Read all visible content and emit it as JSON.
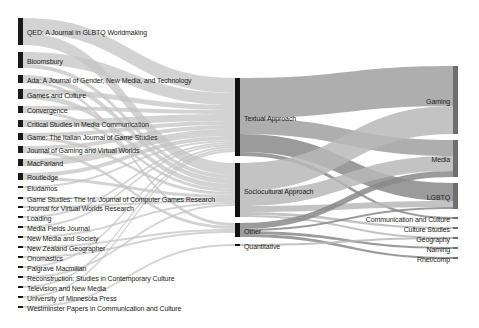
{
  "chart_data": {
    "type": "sankey",
    "title": "",
    "columns": [
      "Publication Venue",
      "Approach",
      "Field"
    ],
    "colors": {
      "node_left": "#1a1a1a",
      "node_mid": "#111111",
      "node_right": "#6e6e6e",
      "flow_left": "#c4c4c4",
      "flow_mid": "#a0a0a0",
      "flow_mid_dark": "#8a8a8a",
      "background": "#ffffff"
    },
    "nodes_left": [
      {
        "id": "qed",
        "label": "QED: A Journal in GLBTQ Worldmaking",
        "y0": 18,
        "y1": 45
      },
      {
        "id": "bloomsbury",
        "label": "Bloomsbury",
        "y0": 52,
        "y1": 68
      },
      {
        "id": "ada",
        "label": "Ada: A Journal of Gender, New Media, and Technology",
        "y0": 75,
        "y1": 83
      },
      {
        "id": "gac",
        "label": "Games and Culture",
        "y0": 89,
        "y1": 99
      },
      {
        "id": "convergence",
        "label": "Convergence",
        "y0": 106,
        "y1": 113
      },
      {
        "id": "csmc",
        "label": "Critical Studies in Media Communication",
        "y0": 120,
        "y1": 127
      },
      {
        "id": "game_ital",
        "label": "Game: The Italian Journal of Game Studies",
        "y0": 133,
        "y1": 140
      },
      {
        "id": "jgvw",
        "label": "Journal of Gaming and Virtual Worlds",
        "y0": 146,
        "y1": 153
      },
      {
        "id": "macfarland",
        "label": "MacFarland",
        "y0": 159,
        "y1": 166
      },
      {
        "id": "routledge",
        "label": "Routledge",
        "y0": 173,
        "y1": 180
      },
      {
        "id": "eludamos",
        "label": "Eludamos",
        "y0": 186,
        "y1": 188
      },
      {
        "id": "gamestudies",
        "label": "Game Studies: The Int. Journal of Computer Games Research",
        "y0": 197,
        "y1": 199
      },
      {
        "id": "jvwr",
        "label": "Journal for Virtual Worlds Research",
        "y0": 206,
        "y1": 208
      },
      {
        "id": "loading",
        "label": "Loading",
        "y0": 216,
        "y1": 218
      },
      {
        "id": "mfj",
        "label": "Media Fields Journal",
        "y0": 226,
        "y1": 228
      },
      {
        "id": "nms",
        "label": "New Media and Society",
        "y0": 236,
        "y1": 238
      },
      {
        "id": "nzg",
        "label": "New Zealand Geographer",
        "y0": 246,
        "y1": 248
      },
      {
        "id": "onomastics",
        "label": "Onomastics",
        "y0": 256,
        "y1": 258
      },
      {
        "id": "palgrave",
        "label": "Palgrave Macmillan",
        "y0": 266,
        "y1": 268
      },
      {
        "id": "reconstruction",
        "label": "Reconstruction: Studies in Contemporary Culture",
        "y0": 276,
        "y1": 278
      },
      {
        "id": "tnm",
        "label": "Television and New Media",
        "y0": 286,
        "y1": 288
      },
      {
        "id": "umn",
        "label": "University of Minnesota Press",
        "y0": 296,
        "y1": 298
      },
      {
        "id": "westminster",
        "label": "Westminster Papers in Communication and Culture",
        "y0": 306,
        "y1": 308
      }
    ],
    "nodes_mid": [
      {
        "id": "textual",
        "label": "Textual Approach",
        "y0": 78,
        "y1": 156
      },
      {
        "id": "socio",
        "label": "Sociocultural Approach",
        "y0": 163,
        "y1": 217
      },
      {
        "id": "other",
        "label": "Other",
        "y0": 223,
        "y1": 237
      },
      {
        "id": "quant",
        "label": "Quantitative",
        "y0": 244,
        "y1": 246
      }
    ],
    "nodes_right": [
      {
        "id": "gaming",
        "label": "Gaming",
        "y0": 66,
        "y1": 134
      },
      {
        "id": "media",
        "label": "Media",
        "y0": 140,
        "y1": 177
      },
      {
        "id": "lgbtq",
        "label": "LGBTQ",
        "y0": 183,
        "y1": 209
      },
      {
        "id": "commcult",
        "label": "Communication and Culture",
        "y0": 217,
        "y1": 219
      },
      {
        "id": "cultstud",
        "label": "Culture Studies",
        "y0": 227,
        "y1": 229
      },
      {
        "id": "geography",
        "label": "Geography",
        "y0": 237,
        "y1": 239
      },
      {
        "id": "naming",
        "label": "Naming",
        "y0": 247,
        "y1": 249
      },
      {
        "id": "rhetcomp",
        "label": "Rhet/comp",
        "y0": 257,
        "y1": 259
      }
    ],
    "links_left": [
      {
        "source": "qed",
        "target": "textual",
        "s0": 18,
        "s1": 33,
        "t0": 78,
        "t1": 93
      },
      {
        "source": "qed",
        "target": "socio",
        "s0": 33,
        "s1": 45,
        "t0": 163,
        "t1": 175
      },
      {
        "source": "bloomsbury",
        "target": "textual",
        "s0": 52,
        "s1": 64,
        "t0": 93,
        "t1": 105
      },
      {
        "source": "bloomsbury",
        "target": "socio",
        "s0": 64,
        "s1": 68,
        "t0": 175,
        "t1": 179
      },
      {
        "source": "ada",
        "target": "socio",
        "s0": 75,
        "s1": 80,
        "t0": 179,
        "t1": 184
      },
      {
        "source": "ada",
        "target": "other",
        "s0": 80,
        "s1": 83,
        "t0": 223,
        "t1": 226
      },
      {
        "source": "gac",
        "target": "textual",
        "s0": 89,
        "s1": 94,
        "t0": 105,
        "t1": 110
      },
      {
        "source": "gac",
        "target": "socio",
        "s0": 94,
        "s1": 99,
        "t0": 184,
        "t1": 189
      },
      {
        "source": "convergence",
        "target": "textual",
        "s0": 106,
        "s1": 110,
        "t0": 110,
        "t1": 114
      },
      {
        "source": "convergence",
        "target": "socio",
        "s0": 110,
        "s1": 113,
        "t0": 189,
        "t1": 192
      },
      {
        "source": "csmc",
        "target": "textual",
        "s0": 120,
        "s1": 127,
        "t0": 114,
        "t1": 121
      },
      {
        "source": "game_ital",
        "target": "textual",
        "s0": 133,
        "s1": 137,
        "t0": 121,
        "t1": 125
      },
      {
        "source": "game_ital",
        "target": "socio",
        "s0": 137,
        "s1": 140,
        "t0": 192,
        "t1": 195
      },
      {
        "source": "jgvw",
        "target": "textual",
        "s0": 146,
        "s1": 150,
        "t0": 125,
        "t1": 129
      },
      {
        "source": "jgvw",
        "target": "other",
        "s0": 150,
        "s1": 153,
        "t0": 226,
        "t1": 229
      },
      {
        "source": "macfarland",
        "target": "textual",
        "s0": 159,
        "s1": 166,
        "t0": 129,
        "t1": 136
      },
      {
        "source": "routledge",
        "target": "textual",
        "s0": 173,
        "s1": 177,
        "t0": 136,
        "t1": 140
      },
      {
        "source": "routledge",
        "target": "socio",
        "s0": 177,
        "s1": 180,
        "t0": 195,
        "t1": 198
      },
      {
        "source": "eludamos",
        "target": "textual",
        "s0": 186,
        "s1": 188,
        "t0": 140,
        "t1": 142
      },
      {
        "source": "gamestudies",
        "target": "socio",
        "s0": 197,
        "s1": 199,
        "t0": 198,
        "t1": 200
      },
      {
        "source": "jvwr",
        "target": "socio",
        "s0": 206,
        "s1": 208,
        "t0": 200,
        "t1": 202
      },
      {
        "source": "loading",
        "target": "textual",
        "s0": 216,
        "s1": 218,
        "t0": 142,
        "t1": 144
      },
      {
        "source": "mfj",
        "target": "textual",
        "s0": 226,
        "s1": 228,
        "t0": 144,
        "t1": 146
      },
      {
        "source": "nms",
        "target": "socio",
        "s0": 236,
        "s1": 238,
        "t0": 202,
        "t1": 204
      },
      {
        "source": "nzg",
        "target": "other",
        "s0": 246,
        "s1": 248,
        "t0": 229,
        "t1": 231
      },
      {
        "source": "onomastics",
        "target": "other",
        "s0": 256,
        "s1": 258,
        "t0": 231,
        "t1": 233
      },
      {
        "source": "palgrave",
        "target": "textual",
        "s0": 266,
        "s1": 268,
        "t0": 146,
        "t1": 148
      },
      {
        "source": "reconstruction",
        "target": "socio",
        "s0": 276,
        "s1": 278,
        "t0": 204,
        "t1": 206
      },
      {
        "source": "tnm",
        "target": "textual",
        "s0": 286,
        "s1": 288,
        "t0": 148,
        "t1": 150
      },
      {
        "source": "umn",
        "target": "textual",
        "s0": 296,
        "s1": 298,
        "t0": 150,
        "t1": 152
      },
      {
        "source": "westminster",
        "target": "quant",
        "s0": 306,
        "s1": 308,
        "t0": 244,
        "t1": 246
      }
    ],
    "links_right": [
      {
        "source": "textual",
        "target": "gaming",
        "s0": 78,
        "s1": 118,
        "t0": 66,
        "t1": 106,
        "shade": "mid"
      },
      {
        "source": "textual",
        "target": "media",
        "s0": 118,
        "s1": 134,
        "t0": 140,
        "t1": 156,
        "shade": "mid"
      },
      {
        "source": "textual",
        "target": "lgbtq",
        "s0": 134,
        "s1": 152,
        "t0": 183,
        "t1": 201,
        "shade": "dark"
      },
      {
        "source": "textual",
        "target": "commcult",
        "s0": 152,
        "s1": 156,
        "t0": 217,
        "t1": 219,
        "shade": "dark"
      },
      {
        "source": "socio",
        "target": "gaming",
        "s0": 163,
        "s1": 191,
        "t0": 106,
        "t1": 134,
        "shade": "light"
      },
      {
        "source": "socio",
        "target": "media",
        "s0": 191,
        "s1": 206,
        "t0": 156,
        "t1": 171,
        "shade": "light"
      },
      {
        "source": "socio",
        "target": "lgbtq",
        "s0": 206,
        "s1": 212,
        "t0": 201,
        "t1": 207,
        "shade": "light"
      },
      {
        "source": "socio",
        "target": "cultstud",
        "s0": 212,
        "s1": 215,
        "t0": 227,
        "t1": 229,
        "shade": "light"
      },
      {
        "source": "socio",
        "target": "geography",
        "s0": 215,
        "s1": 217,
        "t0": 237,
        "t1": 239,
        "shade": "light"
      },
      {
        "source": "other",
        "target": "media",
        "s0": 223,
        "s1": 229,
        "t0": 171,
        "t1": 177,
        "shade": "dark"
      },
      {
        "source": "other",
        "target": "lgbtq",
        "s0": 229,
        "s1": 231,
        "t0": 207,
        "t1": 209,
        "shade": "dark"
      },
      {
        "source": "other",
        "target": "naming",
        "s0": 231,
        "s1": 234,
        "t0": 247,
        "t1": 249,
        "shade": "dark"
      },
      {
        "source": "other",
        "target": "rhetcomp",
        "s0": 234,
        "s1": 237,
        "t0": 257,
        "t1": 259,
        "shade": "dark"
      },
      {
        "source": "quant",
        "target": "geography",
        "s0": 244,
        "s1": 246,
        "t0": 237,
        "t1": 239,
        "shade": "light"
      }
    ]
  }
}
